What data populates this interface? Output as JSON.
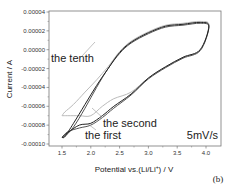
{
  "chart_data": {
    "type": "line",
    "title": "",
    "xlabel": "Potential vs.(Li/Li+) / V",
    "ylabel": "Current / A",
    "xlim": [
      1.3,
      4.3
    ],
    "ylim": [
      -0.00011,
      4e-05
    ],
    "x_ticks": [
      "1.5",
      "2.0",
      "2.5",
      "3.0",
      "3.5",
      "4.0"
    ],
    "y_ticks": [
      "0.00004",
      "0.00002",
      "0.00000",
      "-0.00002",
      "-0.00004",
      "-0.00006",
      "-0.00008",
      "-0.00010"
    ],
    "grid": false,
    "legend": "none (inline annotations)",
    "panel_label": "(b)",
    "scan_rate_label": "5mV/s",
    "series": [
      {
        "name": "the first",
        "color": "#222222",
        "x": [
          1.5,
          1.6,
          1.8,
          2.0,
          2.2,
          2.4,
          2.7,
          3.0,
          3.3,
          3.6,
          3.9,
          4.05,
          3.9,
          3.6,
          3.3,
          3.0,
          2.7,
          2.5,
          2.3,
          2.1,
          1.9,
          1.7,
          1.55,
          1.5
        ],
        "y": [
          -9.3e-05,
          -8.8e-05,
          -8e-05,
          -7.8e-05,
          -7e-05,
          -6e-05,
          -4.7e-05,
          -3e-05,
          -1.8e-05,
          -8e-06,
          0.0,
          2.5e-05,
          2.9e-05,
          2.7e-05,
          2.5e-05,
          1.8e-05,
          8e-06,
          -3e-06,
          -2e-05,
          -3.8e-05,
          -5.8e-05,
          -7.8e-05,
          -9.2e-05,
          -9.3e-05
        ]
      },
      {
        "name": "the second",
        "color": "#555555",
        "x": [
          1.5,
          1.6,
          1.8,
          2.0,
          2.2,
          2.4,
          2.7,
          3.0,
          3.3,
          3.6,
          3.9,
          4.05,
          3.9,
          3.6,
          3.3,
          3.0,
          2.7,
          2.5,
          2.3,
          2.1,
          1.9,
          1.7,
          1.55,
          1.5
        ],
        "y": [
          -9.3e-05,
          -8.7e-05,
          -8.3e-05,
          -8e-05,
          -7.2e-05,
          -6.2e-05,
          -4.8e-05,
          -3.1e-05,
          -1.9e-05,
          -9e-06,
          -1e-06,
          2.4e-05,
          2.8e-05,
          2.6e-05,
          2.4e-05,
          1.7e-05,
          7e-06,
          -4e-06,
          -2e-05,
          -4e-05,
          -6.2e-05,
          -8.2e-05,
          -9.2e-05,
          -9.3e-05
        ]
      },
      {
        "name": "the tenth",
        "color": "#bbbbbb",
        "x": [
          1.5,
          1.6,
          1.8,
          2.0,
          2.2,
          2.4,
          2.7,
          3.0,
          3.3,
          3.6,
          3.9,
          4.05,
          3.9,
          3.6,
          3.3,
          3.0,
          2.7,
          2.5,
          2.3,
          2.1,
          1.9,
          1.7,
          1.55,
          1.5
        ],
        "y": [
          -7e-05,
          -7e-05,
          -7e-05,
          -7e-05,
          -6e-05,
          -5.2e-05,
          -4.5e-05,
          -3e-05,
          -1.8e-05,
          -8e-06,
          0.0,
          2.6e-05,
          3e-05,
          2.8e-05,
          2.6e-05,
          1.9e-05,
          9e-06,
          -2e-06,
          -1.8e-05,
          -3.2e-05,
          -4.5e-05,
          -5.8e-05,
          -6.6e-05,
          -7e-05
        ]
      }
    ],
    "annotations": [
      {
        "text": "the tenth",
        "x": 1.58,
        "y": -2.1e-05
      },
      {
        "text": "the second",
        "x": 2.45,
        "y": -7.3e-05
      },
      {
        "text": "the first",
        "x": 2.05,
        "y": -8.8e-05
      },
      {
        "text": "5mV/s",
        "x": 3.85,
        "y": -8.8e-05
      }
    ]
  }
}
